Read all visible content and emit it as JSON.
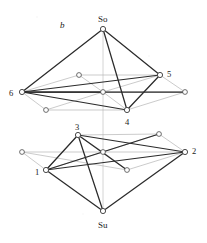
{
  "figure": {
    "panel_label": "b",
    "caption_note": "",
    "width": 207,
    "height": 243,
    "background_color": "#ffffff",
    "strong_edge_color": "#2b2b2b",
    "faint_edge_color": "#b4b4b4",
    "axis_color": "#c9c9c9",
    "node_stroke_color": "#4a4a4a",
    "node_fill_color": "#ffffff"
  },
  "labels": {
    "panel": "b",
    "top_apex": "So",
    "bottom_apex": "Su",
    "vertex_6": "6",
    "vertex_5": "5",
    "vertex_4": "4",
    "vertex_3": "3",
    "vertex_1": "1",
    "vertex_2": "2"
  },
  "chart_data": {
    "type": "diagram",
    "title": "b",
    "xlabel": "",
    "ylabel": "",
    "nodes": [
      {
        "id": "So",
        "label": "So",
        "x": 103,
        "y": 29,
        "kind": "apex",
        "label_dx": 0,
        "label_dy": -10,
        "label_anchor": "middle"
      },
      {
        "id": "U6",
        "label": "6",
        "x": 22,
        "y": 92,
        "kind": "labeled",
        "label_dx": -9,
        "label_dy": 1,
        "label_anchor": "end"
      },
      {
        "id": "U5",
        "label": "5",
        "x": 160,
        "y": 75,
        "kind": "labeled",
        "label_dx": 7,
        "label_dy": -1,
        "label_anchor": "start"
      },
      {
        "id": "U4",
        "label": "4",
        "x": 127,
        "y": 110,
        "kind": "labeled",
        "label_dx": 0,
        "label_dy": 12,
        "label_anchor": "middle"
      },
      {
        "id": "UA",
        "label": "",
        "x": 79,
        "y": 75,
        "kind": "open",
        "label_dx": 0,
        "label_dy": 0,
        "label_anchor": "middle"
      },
      {
        "id": "UB",
        "label": "",
        "x": 185,
        "y": 92,
        "kind": "open",
        "label_dx": 0,
        "label_dy": 0,
        "label_anchor": "middle"
      },
      {
        "id": "UC",
        "label": "",
        "x": 46,
        "y": 110,
        "kind": "open",
        "label_dx": 0,
        "label_dy": 0,
        "label_anchor": "middle"
      },
      {
        "id": "UM",
        "label": "",
        "x": 103,
        "y": 92,
        "kind": "open",
        "label_dx": 0,
        "label_dy": 0,
        "label_anchor": "middle"
      },
      {
        "id": "L3",
        "label": "3",
        "x": 78,
        "y": 135,
        "kind": "labeled",
        "label_dx": -1,
        "label_dy": -8,
        "label_anchor": "middle"
      },
      {
        "id": "L1",
        "label": "1",
        "x": 46,
        "y": 170,
        "kind": "labeled",
        "label_dx": -7,
        "label_dy": 2,
        "label_anchor": "end"
      },
      {
        "id": "L2",
        "label": "2",
        "x": 185,
        "y": 152,
        "kind": "labeled",
        "label_dx": 7,
        "label_dy": -1,
        "label_anchor": "start"
      },
      {
        "id": "LA",
        "label": "",
        "x": 159,
        "y": 134,
        "kind": "open",
        "label_dx": 0,
        "label_dy": 0,
        "label_anchor": "middle"
      },
      {
        "id": "LB",
        "label": "",
        "x": 22,
        "y": 152,
        "kind": "open",
        "label_dx": 0,
        "label_dy": 0,
        "label_anchor": "middle"
      },
      {
        "id": "LC",
        "label": "",
        "x": 127,
        "y": 170,
        "kind": "open",
        "label_dx": 0,
        "label_dy": 0,
        "label_anchor": "middle"
      },
      {
        "id": "LM",
        "label": "",
        "x": 103,
        "y": 152,
        "kind": "open",
        "label_dx": 0,
        "label_dy": 0,
        "label_anchor": "middle"
      },
      {
        "id": "Su",
        "label": "Su",
        "x": 103,
        "y": 211,
        "kind": "apex",
        "label_dx": 0,
        "label_dy": 14,
        "label_anchor": "middle"
      }
    ],
    "strong_edges": [
      [
        "So",
        "U6"
      ],
      [
        "So",
        "U5"
      ],
      [
        "So",
        "U4"
      ],
      [
        "U6",
        "U5"
      ],
      [
        "U6",
        "U4"
      ],
      [
        "U5",
        "U4"
      ],
      [
        "U6",
        "UB"
      ],
      [
        "U6",
        "UM"
      ],
      [
        "L3",
        "L1"
      ],
      [
        "L3",
        "L2"
      ],
      [
        "L1",
        "L2"
      ],
      [
        "L3",
        "Su"
      ],
      [
        "L1",
        "Su"
      ],
      [
        "L2",
        "Su"
      ],
      [
        "L1",
        "LA"
      ],
      [
        "L3",
        "LC"
      ]
    ],
    "faint_edges": [
      [
        "U6",
        "UA"
      ],
      [
        "UA",
        "U5"
      ],
      [
        "U5",
        "UB"
      ],
      [
        "UB",
        "U4"
      ],
      [
        "U4",
        "UC"
      ],
      [
        "UC",
        "U6"
      ],
      [
        "UA",
        "UM"
      ],
      [
        "UB",
        "UM"
      ],
      [
        "UC",
        "UM"
      ],
      [
        "UM",
        "U6"
      ],
      [
        "UM",
        "U5"
      ],
      [
        "UM",
        "U4"
      ],
      [
        "L1",
        "L3"
      ],
      [
        "L3",
        "LA"
      ],
      [
        "LA",
        "L2"
      ],
      [
        "L2",
        "LC"
      ],
      [
        "LC",
        "LB"
      ],
      [
        "LB",
        "L1"
      ],
      [
        "LA",
        "LM"
      ],
      [
        "LB",
        "LM"
      ],
      [
        "LC",
        "LM"
      ],
      [
        "LM",
        "L1"
      ],
      [
        "LM",
        "L2"
      ],
      [
        "LM",
        "L3"
      ]
    ],
    "axis": {
      "x": 103,
      "y1": 29,
      "y2": 211
    }
  }
}
